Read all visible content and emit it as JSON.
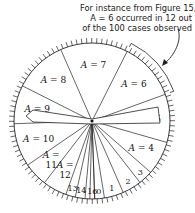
{
  "annotation": {
    "lines": [
      "For instance from Figure 15,",
      "A = 6 occurred in 12 out",
      "of the 100 cases observed"
    ]
  },
  "wheel": {
    "center": [
      92,
      121
    ],
    "radius": 78,
    "tick_count": 100,
    "line_color": "#222222",
    "sectors": [
      {
        "label": "A = 0",
        "short": "0",
        "count": 2
      },
      {
        "label": "A = 1",
        "short": "1",
        "count": 4
      },
      {
        "label": "A = 2",
        "short": "2",
        "count": 4
      },
      {
        "label": "A = 3",
        "short": "3",
        "count": 3
      },
      {
        "label": "A = 4",
        "short": "A = 4",
        "count": 7
      },
      {
        "label": "A = 5",
        "short": "A = 5",
        "count": 10
      },
      {
        "label": "A = 6",
        "short": "A = 6",
        "count": 12
      },
      {
        "label": "A = 7",
        "short": "A = 7",
        "count": 14
      },
      {
        "label": "A = 8",
        "short": "A = 8",
        "count": 11
      },
      {
        "label": "A = 9",
        "short": "A = 9",
        "count": 8
      },
      {
        "label": "A = 10",
        "short": "A = 10",
        "count": 9
      },
      {
        "label": "A = 11",
        "short": "A =\n11",
        "count": 5
      },
      {
        "label": "A = 12",
        "short": "A =\n12",
        "count": 5
      },
      {
        "label": "A = 13",
        "short": "13",
        "count": 2
      },
      {
        "label": "A = 14",
        "short": "14",
        "count": 2
      },
      {
        "label": "A = 15",
        "short": "",
        "count": 1
      },
      {
        "label": "A = 16",
        "short": "16",
        "count": 1
      }
    ]
  }
}
